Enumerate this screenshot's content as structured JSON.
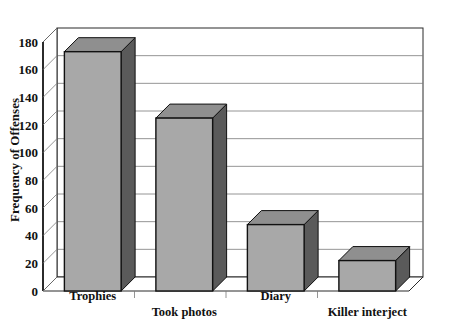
{
  "chart_data": {
    "type": "bar",
    "title": "",
    "subtitle": "",
    "xlabel": "",
    "ylabel": "Frequency of Offenses",
    "categories": [
      "Trophies",
      "Took photos",
      "Diary",
      "Killer interject"
    ],
    "values": [
      173,
      125,
      48,
      22
    ],
    "ylim": [
      0,
      180
    ],
    "ytick_step": 20,
    "yticks": [
      "0",
      "20",
      "40",
      "60",
      "80",
      "100",
      "120",
      "140",
      "160",
      "180"
    ],
    "ytick_values": [
      0,
      20,
      40,
      60,
      80,
      100,
      120,
      140,
      160,
      180
    ],
    "grid": true,
    "grid_axis": "y",
    "legend": "none",
    "style": "3d-bars",
    "colors": {
      "bar_front": "#a8a8a8",
      "bar_top": "#8f8f8f",
      "bar_side": "#5a5a5a",
      "bar_outline": "#111111",
      "gridline": "#7a7a7a",
      "axis": "#111111",
      "background": "#ffffff",
      "text": "#111111"
    }
  }
}
